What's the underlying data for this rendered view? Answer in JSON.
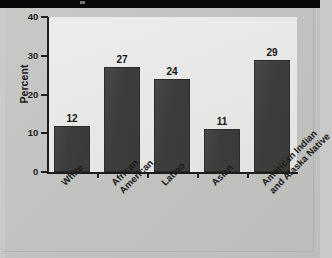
{
  "figure": {
    "background_color": "#c4c4c2",
    "plot_background_color": "#e8e8e6",
    "bar_color": "#3d3d3b",
    "axis_color": "#1d1d1d",
    "top_band_color": "#080808"
  },
  "chart_data": {
    "type": "bar",
    "title": "",
    "xlabel": "",
    "ylabel": "Percent",
    "ylim": [
      0,
      40
    ],
    "yticks": [
      0,
      10,
      20,
      30,
      40
    ],
    "ytick_labels": [
      "0",
      "10",
      "20",
      "30",
      "40"
    ],
    "grid": false,
    "legend": null,
    "categories": [
      "White",
      "African American",
      "Latino",
      "Asian",
      "American Indian and Alaska Native"
    ],
    "category_lines": [
      [
        "White"
      ],
      [
        "African",
        "American"
      ],
      [
        "Latino"
      ],
      [
        "Asian"
      ],
      [
        "American Indian",
        "and Alaska Native"
      ]
    ],
    "values": [
      12,
      27,
      24,
      11,
      29
    ],
    "data_labels": [
      "12",
      "27",
      "24",
      "11",
      "29"
    ]
  }
}
